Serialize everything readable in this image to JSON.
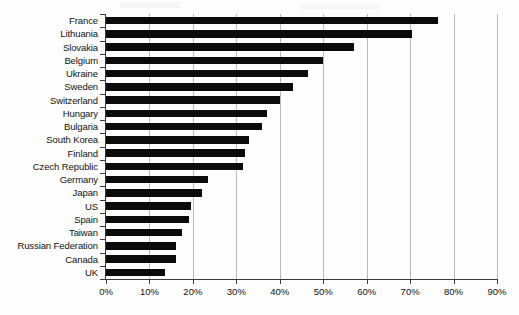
{
  "chart_data": {
    "type": "bar",
    "orientation": "horizontal",
    "title": "",
    "subtitle": "",
    "xlabel": "",
    "ylabel": "",
    "xlim": [
      0,
      90
    ],
    "xtick_labels": [
      "0%",
      "10%",
      "20%",
      "30%",
      "40%",
      "50%",
      "60%",
      "70%",
      "80%",
      "90%"
    ],
    "xtick_values": [
      0,
      10,
      20,
      30,
      40,
      50,
      60,
      70,
      80,
      90
    ],
    "grid": "vertical",
    "legend": "none",
    "units": "percent",
    "bar_color": "#0b0b0b",
    "grid_color": "#b9b9b9",
    "axis_color": "#3a3a3a",
    "categories": [
      "France",
      "Lithuania",
      "Slovakia",
      "Belgium",
      "Ukraine",
      "Sweden",
      "Switzerland",
      "Hungary",
      "Bulgaria",
      "South Korea",
      "Finland",
      "Czech Republic",
      "Germany",
      "Japan",
      "US",
      "Spain",
      "Taiwan",
      "Russian Federation",
      "Canada",
      "UK"
    ],
    "values": [
      76.5,
      70.5,
      57.0,
      50.0,
      46.5,
      43.0,
      40.0,
      37.0,
      36.0,
      33.0,
      32.0,
      31.5,
      23.5,
      22.0,
      19.5,
      19.0,
      17.5,
      16.2,
      16.0,
      13.5
    ]
  }
}
